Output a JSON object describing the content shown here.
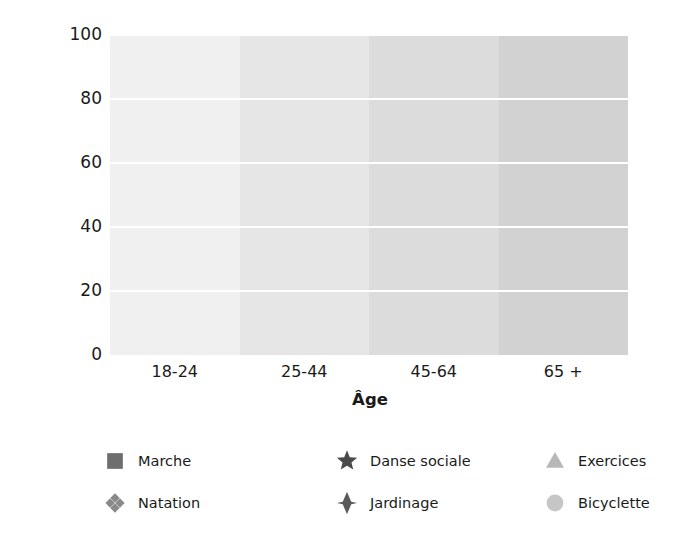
{
  "chart_data": {
    "type": "line",
    "title": "",
    "xlabel": "Âge",
    "ylabel": "Nombre d'amateurs (%)",
    "categories": [
      "18-24",
      "25-44",
      "45-64",
      "65 +"
    ],
    "ylim": [
      0,
      100
    ],
    "yticks": [
      100,
      80,
      60,
      40,
      20,
      0
    ],
    "grid": true,
    "legend_position": "bottom",
    "background_bands": [
      "#f0f0f0",
      "#e6e6e6",
      "#dcdcdc",
      "#d2d2d2"
    ],
    "series": [
      {
        "name": "Marche",
        "marker": "square",
        "color": "#6e6e6e",
        "values": [
          89,
          90,
          90,
          81
        ]
      },
      {
        "name": "Jardinage",
        "marker": "diamond",
        "color": "#5a5a5a",
        "values": [
          66,
          80,
          79,
          70
        ]
      },
      {
        "name": "Natation",
        "marker": "diamond-cluster",
        "color": "#8a8a8a",
        "values": [
          62,
          58,
          45,
          32
        ]
      },
      {
        "name": "Exercices",
        "marker": "triangle",
        "color": "#b8b8b8",
        "values": [
          65,
          59,
          52,
          42
        ]
      },
      {
        "name": "Danse sociale",
        "marker": "star",
        "color": "#4a4a4a",
        "values": [
          76,
          54,
          45,
          21
        ]
      },
      {
        "name": "Bicyclette",
        "marker": "circle",
        "color": "#c6c6c6",
        "values": [
          64,
          61,
          38,
          10
        ]
      }
    ]
  },
  "axes": {
    "ylabel": "Nombre d'amateurs (%)",
    "xlabel": "Âge",
    "ytick_labels": [
      "100",
      "80",
      "60",
      "40",
      "20",
      "0"
    ],
    "xtick_labels": [
      "18-24",
      "25-44",
      "45-64",
      "65 +"
    ]
  },
  "legend": {
    "items": [
      {
        "label": "Marche",
        "marker": "square",
        "color": "#6e6e6e"
      },
      {
        "label": "Natation",
        "marker": "diamond-cluster",
        "color": "#8a8a8a"
      },
      {
        "label": "Danse sociale",
        "marker": "star",
        "color": "#4a4a4a"
      },
      {
        "label": "Jardinage",
        "marker": "diamond",
        "color": "#5a5a5a"
      },
      {
        "label": "Exercices",
        "marker": "triangle",
        "color": "#b8b8b8"
      },
      {
        "label": "Bicyclette",
        "marker": "circle",
        "color": "#c6c6c6"
      }
    ]
  }
}
